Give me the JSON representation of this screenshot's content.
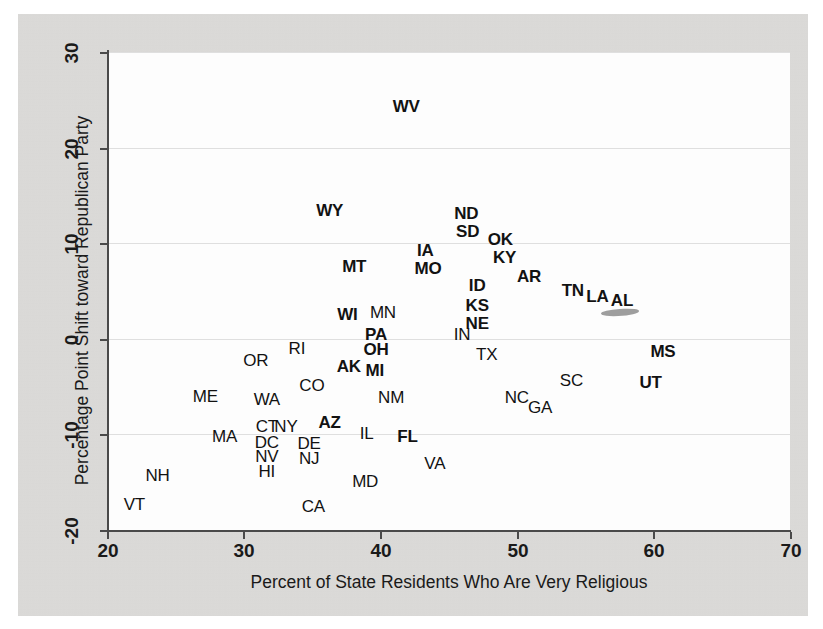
{
  "figure": {
    "type": "scatter-text-labels",
    "background_color": "#dedddb",
    "plot_background_color": "#fdfdfd",
    "label_color": "#121212"
  },
  "chart_data": {
    "type": "scatter",
    "title": "",
    "xlabel": "Percent of State Residents Who Are Very Religious",
    "ylabel": "Percentage Point Shift toward Republican Party",
    "xlim": [
      20,
      70
    ],
    "ylim": [
      -20,
      30
    ],
    "xticks": [
      20,
      30,
      40,
      50,
      60,
      70
    ],
    "yticks": [
      -20,
      -10,
      0,
      10,
      20,
      30
    ],
    "xtick_labels": [
      "20",
      "30",
      "40",
      "50",
      "60",
      "70"
    ],
    "ytick_labels": [
      "-20",
      "-10",
      "0",
      "10",
      "20",
      "30"
    ],
    "grid": true,
    "grid_axis": "y",
    "legend": "none",
    "marker_style": "state-abbreviation-text",
    "points": [
      {
        "label": "WV",
        "x": 41.9,
        "y": 24.2,
        "weight": "bold"
      },
      {
        "label": "WY",
        "x": 36.3,
        "y": 13.4,
        "weight": "bold"
      },
      {
        "label": "ND",
        "x": 46.3,
        "y": 13.1,
        "weight": "bold"
      },
      {
        "label": "SD",
        "x": 46.4,
        "y": 11.2,
        "weight": "bold"
      },
      {
        "label": "OK",
        "x": 48.8,
        "y": 10.3,
        "weight": "bold"
      },
      {
        "label": "IA",
        "x": 43.3,
        "y": 9.2,
        "weight": "bold"
      },
      {
        "label": "KY",
        "x": 49.1,
        "y": 8.4,
        "weight": "bold"
      },
      {
        "label": "MT",
        "x": 38.1,
        "y": 7.5,
        "weight": "bold"
      },
      {
        "label": "MO",
        "x": 43.5,
        "y": 7.3,
        "weight": "bold"
      },
      {
        "label": "AR",
        "x": 50.9,
        "y": 6.5,
        "weight": "bold"
      },
      {
        "label": "ID",
        "x": 47.1,
        "y": 5.5,
        "weight": "bold"
      },
      {
        "label": "TN",
        "x": 54.1,
        "y": 5.0,
        "weight": "bold"
      },
      {
        "label": "LA",
        "x": 55.9,
        "y": 4.4,
        "weight": "bold"
      },
      {
        "label": "KS",
        "x": 47.1,
        "y": 3.4,
        "weight": "bold"
      },
      {
        "label": "AL",
        "x": 57.7,
        "y": 4.0,
        "weight": "bold"
      },
      {
        "label": "WI",
        "x": 37.6,
        "y": 2.5,
        "weight": "bold"
      },
      {
        "label": "MN",
        "x": 40.2,
        "y": 2.7,
        "weight": "regular"
      },
      {
        "label": "NE",
        "x": 47.1,
        "y": 1.6,
        "weight": "bold"
      },
      {
        "label": "PA",
        "x": 39.7,
        "y": 0.4,
        "weight": "bold"
      },
      {
        "label": "IN",
        "x": 46.0,
        "y": 0.4,
        "weight": "regular"
      },
      {
        "label": "RI",
        "x": 33.9,
        "y": -1.1,
        "weight": "regular"
      },
      {
        "label": "OH",
        "x": 39.7,
        "y": -1.2,
        "weight": "bold"
      },
      {
        "label": "TX",
        "x": 47.8,
        "y": -1.7,
        "weight": "regular"
      },
      {
        "label": "MS",
        "x": 60.7,
        "y": -1.4,
        "weight": "bold"
      },
      {
        "label": "OR",
        "x": 30.9,
        "y": -2.3,
        "weight": "regular"
      },
      {
        "label": "AK",
        "x": 37.7,
        "y": -3.0,
        "weight": "bold"
      },
      {
        "label": "MI",
        "x": 39.6,
        "y": -3.4,
        "weight": "bold"
      },
      {
        "label": "CO",
        "x": 35.0,
        "y": -4.9,
        "weight": "regular"
      },
      {
        "label": "UT",
        "x": 59.8,
        "y": -4.6,
        "weight": "bold"
      },
      {
        "label": "SC",
        "x": 54.0,
        "y": -4.4,
        "weight": "regular"
      },
      {
        "label": "ME",
        "x": 27.2,
        "y": -6.1,
        "weight": "regular"
      },
      {
        "label": "WA",
        "x": 31.7,
        "y": -6.4,
        "weight": "regular"
      },
      {
        "label": "NM",
        "x": 40.8,
        "y": -6.2,
        "weight": "regular"
      },
      {
        "label": "NC",
        "x": 50.0,
        "y": -6.2,
        "weight": "regular"
      },
      {
        "label": "GA",
        "x": 51.7,
        "y": -7.2,
        "weight": "regular"
      },
      {
        "label": "AZ",
        "x": 36.3,
        "y": -8.8,
        "weight": "bold"
      },
      {
        "label": "CT",
        "x": 31.7,
        "y": -9.2,
        "weight": "regular"
      },
      {
        "label": "NY",
        "x": 33.1,
        "y": -9.2,
        "weight": "regular"
      },
      {
        "label": "IL",
        "x": 39.0,
        "y": -10.0,
        "weight": "regular"
      },
      {
        "label": "FL",
        "x": 42.0,
        "y": -10.3,
        "weight": "bold"
      },
      {
        "label": "MA",
        "x": 28.6,
        "y": -10.3,
        "weight": "regular"
      },
      {
        "label": "DC",
        "x": 31.7,
        "y": -10.9,
        "weight": "regular"
      },
      {
        "label": "DE",
        "x": 34.8,
        "y": -11.0,
        "weight": "regular"
      },
      {
        "label": "NV",
        "x": 31.7,
        "y": -12.4,
        "weight": "regular"
      },
      {
        "label": "NJ",
        "x": 34.8,
        "y": -12.6,
        "weight": "regular"
      },
      {
        "label": "NH",
        "x": 23.7,
        "y": -14.3,
        "weight": "regular"
      },
      {
        "label": "VA",
        "x": 44.0,
        "y": -13.1,
        "weight": "regular"
      },
      {
        "label": "HI",
        "x": 31.7,
        "y": -13.9,
        "weight": "regular"
      },
      {
        "label": "MD",
        "x": 38.9,
        "y": -15.0,
        "weight": "regular"
      },
      {
        "label": "VT",
        "x": 22.0,
        "y": -17.4,
        "weight": "regular"
      },
      {
        "label": "CA",
        "x": 35.1,
        "y": -17.6,
        "weight": "regular"
      }
    ]
  }
}
